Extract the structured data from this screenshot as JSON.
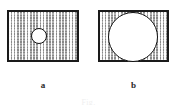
{
  "figure": {
    "type": "technical-line-drawing",
    "background_color": "#ffffff",
    "caption": {
      "text": "Fig.",
      "visible": "partially-cropped",
      "color": "#efefef"
    },
    "panels": [
      {
        "id": "a",
        "label": "a",
        "shape": "rectangle",
        "fill": "stipple-gray",
        "fill_color": "#d2d2d2",
        "border_color": "#1a1a1a",
        "x": 7,
        "y": 10,
        "width": 72,
        "height": 52,
        "hole": {
          "shape": "circle",
          "label": "small-hole",
          "fill_color": "#ffffff",
          "border_color": "#111111",
          "center_x": 39,
          "center_y": 36,
          "radius": 8,
          "diameter": 16
        }
      },
      {
        "id": "b",
        "label": "b",
        "shape": "rectangle",
        "fill": "stipple-gray",
        "fill_color": "#d2d2d2",
        "border_color": "#1a1a1a",
        "x": 98,
        "y": 10,
        "width": 71,
        "height": 52,
        "hole": {
          "shape": "circle",
          "label": "large-hole",
          "fill_color": "#ffffff",
          "border_color": "#111111",
          "center_x": 133,
          "center_y": 37,
          "radius": 25,
          "diameter": 50
        }
      }
    ]
  }
}
